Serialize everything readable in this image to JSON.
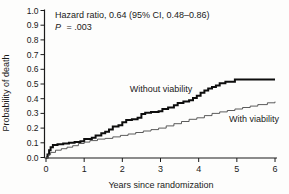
{
  "figure": {
    "background": "#fdfdfc",
    "ink_color": "#1a1a1a"
  },
  "chart_data": {
    "type": "line",
    "subtype": "kaplan-meier-step",
    "title": "",
    "xlabel": "Years since randomization",
    "ylabel": "Probability of death",
    "xlim": [
      0,
      6
    ],
    "ylim": [
      0.0,
      1.0
    ],
    "x_ticks": [
      "0",
      "1",
      "2",
      "3",
      "4",
      "5",
      "6"
    ],
    "y_ticks": [
      "0.0",
      "0.1",
      "0.2",
      "0.3",
      "0.4",
      "0.5",
      "0.6",
      "0.7",
      "0.8",
      "0.9",
      "1.0"
    ],
    "grid": false,
    "legend_position": "inline-labels",
    "annotations": {
      "hazard_ratio": "Hazard ratio, 0.64 (95% CI, 0.48–0.86)",
      "p_prefix": "P",
      "p_suffix": "= .003"
    },
    "series": [
      {
        "name": "without-viability",
        "label": "Without viability",
        "color": "#0d0d0d",
        "line_width": 2,
        "points": [
          [
            0,
            0
          ],
          [
            0.04,
            0.02
          ],
          [
            0.08,
            0.05
          ],
          [
            0.12,
            0.07
          ],
          [
            0.18,
            0.085
          ],
          [
            0.3,
            0.09
          ],
          [
            0.45,
            0.095
          ],
          [
            0.6,
            0.1
          ],
          [
            0.75,
            0.105
          ],
          [
            0.9,
            0.11
          ],
          [
            1.0,
            0.125
          ],
          [
            1.2,
            0.135
          ],
          [
            1.3,
            0.15
          ],
          [
            1.45,
            0.165
          ],
          [
            1.55,
            0.175
          ],
          [
            1.65,
            0.19
          ],
          [
            1.75,
            0.21
          ],
          [
            1.9,
            0.22
          ],
          [
            2.0,
            0.24
          ],
          [
            2.1,
            0.255
          ],
          [
            2.25,
            0.26
          ],
          [
            2.4,
            0.27
          ],
          [
            2.5,
            0.295
          ],
          [
            2.6,
            0.305
          ],
          [
            2.75,
            0.31
          ],
          [
            2.95,
            0.315
          ],
          [
            3.05,
            0.33
          ],
          [
            3.2,
            0.34
          ],
          [
            3.35,
            0.355
          ],
          [
            3.45,
            0.37
          ],
          [
            3.6,
            0.38
          ],
          [
            3.75,
            0.39
          ],
          [
            3.85,
            0.405
          ],
          [
            3.95,
            0.42
          ],
          [
            4.05,
            0.44
          ],
          [
            4.15,
            0.455
          ],
          [
            4.25,
            0.47
          ],
          [
            4.35,
            0.48
          ],
          [
            4.45,
            0.49
          ],
          [
            4.55,
            0.505
          ],
          [
            4.7,
            0.515
          ],
          [
            4.95,
            0.53
          ],
          [
            6.0,
            0.53
          ]
        ]
      },
      {
        "name": "with-viability",
        "label": "With viability",
        "color": "#4a4a4a",
        "line_width": 0.9,
        "points": [
          [
            0,
            0
          ],
          [
            0.06,
            0.02
          ],
          [
            0.12,
            0.035
          ],
          [
            0.25,
            0.05
          ],
          [
            0.4,
            0.06
          ],
          [
            0.55,
            0.07
          ],
          [
            0.7,
            0.08
          ],
          [
            0.85,
            0.095
          ],
          [
            1.0,
            0.105
          ],
          [
            1.15,
            0.115
          ],
          [
            1.35,
            0.125
          ],
          [
            1.55,
            0.13
          ],
          [
            1.75,
            0.14
          ],
          [
            1.95,
            0.15
          ],
          [
            2.15,
            0.16
          ],
          [
            2.35,
            0.17
          ],
          [
            2.55,
            0.18
          ],
          [
            2.75,
            0.19
          ],
          [
            2.95,
            0.2
          ],
          [
            3.15,
            0.215
          ],
          [
            3.35,
            0.23
          ],
          [
            3.55,
            0.245
          ],
          [
            3.75,
            0.26
          ],
          [
            3.95,
            0.27
          ],
          [
            4.15,
            0.285
          ],
          [
            4.35,
            0.3
          ],
          [
            4.55,
            0.31
          ],
          [
            4.75,
            0.32
          ],
          [
            4.95,
            0.33
          ],
          [
            5.15,
            0.34
          ],
          [
            5.35,
            0.35
          ],
          [
            5.55,
            0.36
          ],
          [
            5.8,
            0.372
          ],
          [
            6.0,
            0.38
          ]
        ]
      }
    ]
  }
}
